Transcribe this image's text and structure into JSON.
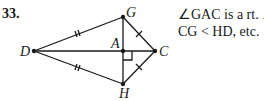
{
  "problem": {
    "number": "33.",
    "note_line1": "∠GAC is a rt. ∠,",
    "note_line2": "CG < HD, etc."
  },
  "diagram": {
    "points": {
      "D": {
        "label": "D",
        "x": 34,
        "y": 51
      },
      "G": {
        "label": "G",
        "x": 123,
        "y": 17
      },
      "A": {
        "label": "A",
        "x": 123,
        "y": 51
      },
      "C": {
        "label": "C",
        "x": 155,
        "y": 51
      },
      "H": {
        "label": "H",
        "x": 123,
        "y": 84
      }
    },
    "segments": [
      "DG",
      "DH",
      "DC",
      "GH",
      "GC",
      "HC"
    ],
    "marks": {
      "DG": "double-tick",
      "DH": "double-tick",
      "GC": "single-tick",
      "HC": "single-tick",
      "A": "right-angle"
    }
  }
}
